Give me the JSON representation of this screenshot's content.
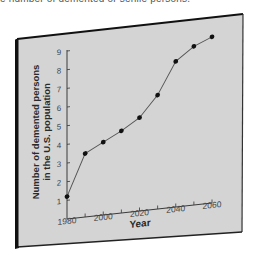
{
  "caption": "e number of demented or senile persons.",
  "colors": {
    "panel_fill": "#d4d4d4",
    "panel_edge": "#1a1a1a",
    "axis": "#3a3a3a",
    "line": "#555555",
    "marker": "#111111",
    "tick_label": "#444444",
    "axis_label": "#2a2a2a"
  },
  "chart_data": {
    "type": "line",
    "title": "",
    "xlabel": "Year",
    "ylabel": "Number of demented persons in the U.S. population",
    "ylabel_lines": [
      "Number of demented persons",
      "in the U.S. population"
    ],
    "x": [
      1980,
      1990,
      2000,
      2010,
      2020,
      2030,
      2040,
      2050,
      2060
    ],
    "series": [
      {
        "name": "Demented persons",
        "values": [
          1.2,
          3.4,
          3.9,
          4.4,
          5.0,
          6.1,
          7.8,
          8.5,
          8.9
        ]
      }
    ],
    "xlim": [
      1980,
      2060
    ],
    "ylim": [
      0,
      9
    ],
    "x_ticks": [
      1980,
      1990,
      2000,
      2010,
      2020,
      2030,
      2040,
      2050,
      2060
    ],
    "x_tick_labels": [
      "1980",
      "2000",
      "2020",
      "2040",
      "2060"
    ],
    "y_ticks": [
      1,
      2,
      3,
      4,
      5,
      6,
      7,
      8,
      9
    ],
    "y_tick_labels": [
      "1",
      "2",
      "3",
      "4",
      "5",
      "6",
      "7",
      "8",
      "9"
    ],
    "grid": false,
    "legend": "none",
    "markers": true
  }
}
